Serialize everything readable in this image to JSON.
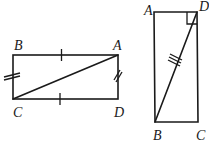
{
  "figures": [
    {
      "id": "left-rectangle",
      "vertices": {
        "B": {
          "label": "B",
          "x": 13,
          "y": 55
        },
        "A": {
          "label": "A",
          "x": 118,
          "y": 55
        },
        "C": {
          "label": "C",
          "x": 13,
          "y": 99
        },
        "D": {
          "label": "D",
          "x": 118,
          "y": 99
        }
      },
      "diagonal": [
        "C",
        "A"
      ],
      "tick_marks": [
        {
          "side": "BA",
          "count": 1
        },
        {
          "side": "CD",
          "count": 1
        },
        {
          "side": "BC",
          "count": 2
        },
        {
          "side": "AD",
          "count": 2
        }
      ]
    },
    {
      "id": "right-rectangle",
      "vertices": {
        "A": {
          "label": "A",
          "x": 154,
          "y": 12
        },
        "D": {
          "label": "D",
          "x": 197,
          "y": 12
        },
        "B": {
          "label": "B",
          "x": 155,
          "y": 122
        },
        "C": {
          "label": "C",
          "x": 198,
          "y": 122
        }
      },
      "diagonal": [
        "B",
        "D"
      ],
      "right_angle_at": "D",
      "tick_marks": [
        {
          "side": "BD",
          "count": 3
        }
      ]
    }
  ],
  "labels": {
    "left": {
      "B": "B",
      "A": "A",
      "C": "C",
      "D": "D"
    },
    "right": {
      "A": "A",
      "D": "D",
      "B": "B",
      "C": "C"
    }
  }
}
